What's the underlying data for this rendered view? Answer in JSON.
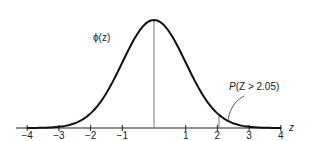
{
  "chart_data": {
    "type": "line",
    "title": "",
    "xlabel": "z",
    "ylabel": "",
    "xlim": [
      -4,
      4
    ],
    "x_ticks": [
      -4,
      -3,
      -2,
      -1,
      1,
      2,
      3,
      4
    ],
    "x_tick_labels": [
      "−4",
      "−3",
      "−2",
      "−1",
      "1",
      "2",
      "3",
      "4"
    ],
    "grid": false,
    "series": [
      {
        "name": "φ(z)",
        "function": "standard normal pdf",
        "x": [
          -4,
          -3,
          -2,
          -1,
          0,
          1,
          2,
          3,
          4
        ],
        "values": [
          0.0001,
          0.0044,
          0.054,
          0.242,
          0.399,
          0.242,
          0.054,
          0.0044,
          0.0001
        ]
      }
    ],
    "vertical_lines": [
      0,
      2.05
    ],
    "annotations": [
      {
        "text": "φ(z)",
        "target": "curve"
      },
      {
        "text": "P(Z > 2.05)",
        "target": "tail area right of 2.05"
      }
    ]
  },
  "labels": {
    "curve": "ϕ(z)",
    "axis": "z",
    "tail_prefix": "P",
    "tail_rest": "(Z > 2.05)"
  }
}
